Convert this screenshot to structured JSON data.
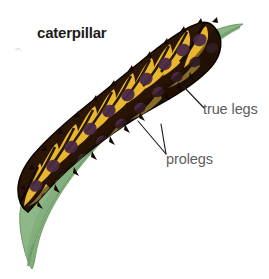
{
  "figure": {
    "name": "caterpillar-on-leaf-diagram",
    "background_color": "#ffffff",
    "width": 269,
    "height": 279
  },
  "labels": {
    "title": "caterpillar",
    "true_legs": "true legs",
    "prolegs": "prolegs"
  },
  "label_styles": {
    "title_color": "#1c1c1c",
    "annotation_color": "#5d5d5d",
    "leader_line_color": "#1e1e1e"
  },
  "illustration": {
    "leaf": {
      "name": "green-leaf",
      "fill": "#8fb98a",
      "edge": "#6f9a6b",
      "midrib": "#79a474",
      "shadow": "#7aa675"
    },
    "caterpillar": {
      "name": "caterpillar-body",
      "base_color": "#2b1708",
      "dark_color": "#140a03",
      "yellow_color": "#e8b730",
      "pale_yellow": "#f2d36a",
      "purple_patch": "#4a2a46",
      "outline": "#0d0703",
      "segment_count": 11,
      "description": "dark brown larva with yellow bands and purple-brown blotches"
    },
    "artifact_mark": {
      "name": "scan-speck",
      "color": "#b9b9b9"
    }
  },
  "annotations": [
    {
      "name": "true-legs-annotation",
      "label": "true legs",
      "leader": "single line from body underside to label"
    },
    {
      "name": "prolegs-annotation",
      "label": "prolegs",
      "leader": "two branching lines meeting at a junction below the body"
    }
  ]
}
